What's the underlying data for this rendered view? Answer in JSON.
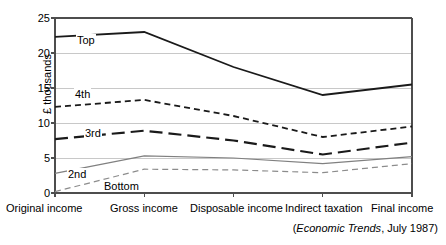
{
  "chart_data": {
    "type": "line",
    "title": "",
    "xlabel": "",
    "ylabel": "£ thousands",
    "ylim": [
      0,
      25
    ],
    "yticks": [
      0,
      5,
      10,
      15,
      20,
      25
    ],
    "grid": true,
    "legend_position": "inline-labels",
    "categories": [
      "Original income",
      "Gross income",
      "Disposable income",
      "Indirect taxation",
      "Final income"
    ],
    "series": [
      {
        "name": "Top",
        "values": [
          22.3,
          23.0,
          18.0,
          14.0,
          15.5
        ],
        "color": "#1a1a1a",
        "style": "solid",
        "width": 1.8
      },
      {
        "name": "4th",
        "values": [
          12.3,
          13.3,
          11.0,
          8.0,
          9.5
        ],
        "color": "#1a1a1a",
        "style": "short-dash",
        "width": 1.8
      },
      {
        "name": "3rd",
        "values": [
          7.7,
          8.9,
          7.5,
          5.5,
          7.2
        ],
        "color": "#1a1a1a",
        "style": "long-dash",
        "width": 2.2
      },
      {
        "name": "2nd",
        "values": [
          2.8,
          5.3,
          5.0,
          4.2,
          5.2
        ],
        "color": "#808080",
        "style": "solid",
        "width": 1.2
      },
      {
        "name": "Bottom",
        "values": [
          0.2,
          3.4,
          3.3,
          2.9,
          4.2
        ],
        "color": "#8c8c8c",
        "style": "short-dash",
        "width": 1.2
      }
    ]
  },
  "axis": {
    "y_title": "£ thousands",
    "y_tick_labels": [
      "25",
      "20",
      "15",
      "10",
      "5",
      "0"
    ],
    "x_tick_labels": [
      "Original income",
      "Gross income",
      "Disposable income",
      "Indirect taxation",
      "Final income"
    ]
  },
  "series_labels": {
    "top": "Top",
    "fourth": "4th",
    "third": "3rd",
    "second": "2nd",
    "bottom": "Bottom"
  },
  "source": {
    "open_paren": "(",
    "italic_part": "Economic Trends",
    "rest": ", July 1987)"
  },
  "colors": {
    "axis": "#4d4d4d",
    "grid": "#c8c8c8",
    "dark_series": "#1a1a1a",
    "gray_series": "#808080",
    "background": "#ffffff"
  }
}
